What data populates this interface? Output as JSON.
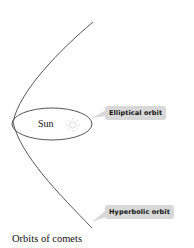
{
  "diagram": {
    "sun_label": "Sun",
    "elliptical_label": "Elliptical orbit",
    "hyperbolic_label": "Hyperbolic orbit",
    "caption": "Orbits of comets",
    "icons": {
      "sun": "sun-icon"
    },
    "colors": {
      "line": "#555555",
      "label_bg": "#d8d8d8",
      "sun_icon": "#dddddd"
    }
  }
}
